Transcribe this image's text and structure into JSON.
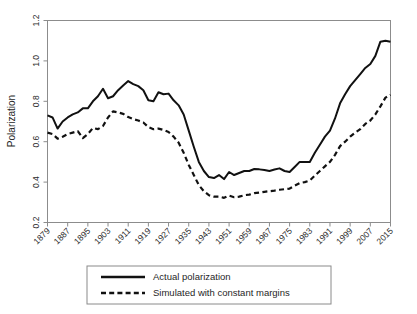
{
  "chart_data": {
    "type": "line",
    "title": "",
    "xlabel": "",
    "ylabel": "Polarization",
    "ylim": [
      0.2,
      1.2
    ],
    "yticks": [
      0.2,
      0.4,
      0.6,
      0.8,
      1.0,
      1.2
    ],
    "ytick_labels": [
      "0.2",
      "0.4",
      "0.6",
      "0.8",
      "1.0",
      "1.2"
    ],
    "xlim": [
      1879,
      2015
    ],
    "xticks": [
      1879,
      1887,
      1895,
      1903,
      1911,
      1919,
      1927,
      1935,
      1943,
      1951,
      1959,
      1967,
      1975,
      1983,
      1991,
      1999,
      2007,
      2015
    ],
    "xtick_labels": [
      "1879",
      "1887",
      "1895",
      "1903",
      "1911",
      "1919",
      "1927",
      "1935",
      "1943",
      "1951",
      "1959",
      "1967",
      "1975",
      "1983",
      "1991",
      "1999",
      "2007",
      "2015"
    ],
    "grid": false,
    "legend_position": "below-center",
    "x": [
      1879,
      1881,
      1883,
      1885,
      1887,
      1889,
      1891,
      1893,
      1895,
      1897,
      1899,
      1901,
      1903,
      1905,
      1907,
      1909,
      1911,
      1913,
      1915,
      1917,
      1919,
      1921,
      1923,
      1925,
      1927,
      1929,
      1931,
      1933,
      1935,
      1937,
      1939,
      1941,
      1943,
      1945,
      1947,
      1949,
      1951,
      1953,
      1955,
      1957,
      1959,
      1961,
      1963,
      1965,
      1967,
      1969,
      1971,
      1973,
      1975,
      1977,
      1979,
      1981,
      1983,
      1985,
      1987,
      1989,
      1991,
      1993,
      1995,
      1997,
      1999,
      2001,
      2003,
      2005,
      2007,
      2009,
      2011,
      2013,
      2015
    ],
    "series": [
      {
        "name": "Actual polarization",
        "style": "solid",
        "color": "#111111",
        "values": [
          0.73,
          0.72,
          0.665,
          0.7,
          0.72,
          0.735,
          0.745,
          0.765,
          0.765,
          0.8,
          0.825,
          0.862,
          0.815,
          0.825,
          0.855,
          0.878,
          0.9,
          0.885,
          0.875,
          0.855,
          0.805,
          0.8,
          0.845,
          0.835,
          0.838,
          0.805,
          0.78,
          0.735,
          0.655,
          0.575,
          0.5,
          0.455,
          0.425,
          0.42,
          0.435,
          0.415,
          0.45,
          0.435,
          0.445,
          0.455,
          0.455,
          0.465,
          0.463,
          0.46,
          0.455,
          0.462,
          0.468,
          0.455,
          0.45,
          0.475,
          0.5,
          0.5,
          0.5,
          0.545,
          0.585,
          0.625,
          0.655,
          0.715,
          0.79,
          0.835,
          0.875,
          0.905,
          0.935,
          0.965,
          0.985,
          1.025,
          1.095,
          1.1,
          1.095
        ]
      },
      {
        "name": "Simulated with constant margins",
        "style": "dashed",
        "color": "#111111",
        "values": [
          0.645,
          0.638,
          0.615,
          0.625,
          0.638,
          0.645,
          0.652,
          0.618,
          0.638,
          0.668,
          0.662,
          0.678,
          0.72,
          0.75,
          0.745,
          0.738,
          0.722,
          0.712,
          0.705,
          0.695,
          0.672,
          0.662,
          0.665,
          0.658,
          0.648,
          0.625,
          0.595,
          0.545,
          0.485,
          0.435,
          0.385,
          0.355,
          0.335,
          0.328,
          0.328,
          0.322,
          0.333,
          0.325,
          0.328,
          0.335,
          0.338,
          0.345,
          0.348,
          0.352,
          0.355,
          0.358,
          0.362,
          0.365,
          0.368,
          0.382,
          0.395,
          0.4,
          0.408,
          0.432,
          0.455,
          0.478,
          0.5,
          0.535,
          0.578,
          0.6,
          0.625,
          0.645,
          0.662,
          0.688,
          0.705,
          0.735,
          0.775,
          0.818,
          0.832
        ]
      }
    ],
    "legend": [
      {
        "label": "Actual polarization",
        "style": "solid"
      },
      {
        "label": "Simulated with constant margins",
        "style": "dashed"
      }
    ]
  }
}
